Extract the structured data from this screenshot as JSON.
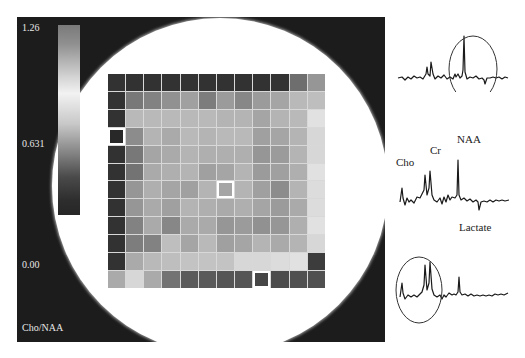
{
  "figure": {
    "type": "MR spectroscopic imaging map with spectra",
    "colorbar": {
      "max_label": "1.26",
      "mid_label": "0.631",
      "min_label": "0.00",
      "metric_label": "Cho/NAA"
    },
    "grid": {
      "rows": 12,
      "cols": 12,
      "highlighted_cells": [
        {
          "row": 3,
          "col": 0
        },
        {
          "row": 6,
          "col": 6
        },
        {
          "row": 11,
          "col": 8
        }
      ],
      "gray_levels": [
        [
          50,
          50,
          50,
          50,
          50,
          50,
          50,
          50,
          50,
          50,
          110,
          150
        ],
        [
          50,
          120,
          130,
          145,
          160,
          125,
          155,
          135,
          155,
          165,
          185,
          190
        ],
        [
          50,
          185,
          185,
          185,
          185,
          185,
          180,
          180,
          165,
          180,
          185,
          225
        ],
        [
          40,
          140,
          180,
          170,
          185,
          180,
          185,
          185,
          160,
          165,
          180,
          215
        ],
        [
          50,
          120,
          165,
          170,
          180,
          175,
          175,
          175,
          150,
          155,
          180,
          215
        ],
        [
          50,
          115,
          170,
          175,
          180,
          160,
          165,
          180,
          155,
          160,
          175,
          225
        ],
        [
          50,
          150,
          175,
          165,
          160,
          180,
          165,
          180,
          160,
          140,
          180,
          220
        ],
        [
          50,
          150,
          170,
          160,
          180,
          175,
          170,
          175,
          165,
          155,
          170,
          220
        ],
        [
          50,
          130,
          170,
          135,
          170,
          170,
          150,
          155,
          145,
          150,
          175,
          225
        ],
        [
          50,
          125,
          130,
          190,
          165,
          185,
          160,
          165,
          180,
          170,
          180,
          215
        ],
        [
          50,
          170,
          185,
          190,
          195,
          195,
          195,
          215,
          215,
          220,
          225,
          60
        ],
        [
          170,
          215,
          170,
          115,
          90,
          90,
          85,
          85,
          70,
          75,
          80,
          80
        ]
      ]
    },
    "spectra": [
      {
        "position": "top",
        "circled_region": "NAA/lactate region",
        "labels": []
      },
      {
        "position": "middle",
        "labels": [
          "Cho",
          "Cr",
          "NAA",
          "Lactate"
        ]
      },
      {
        "position": "bottom",
        "circled_region": "Cho/Cr region",
        "labels": []
      }
    ]
  }
}
